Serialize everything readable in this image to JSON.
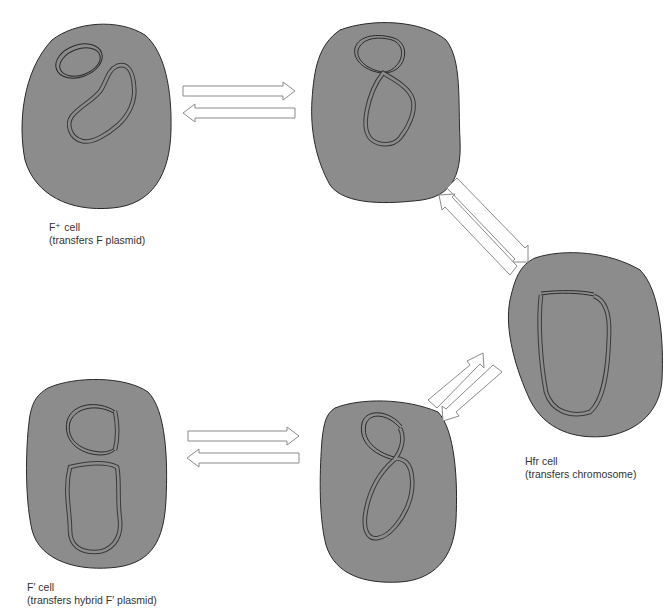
{
  "diagram": {
    "colors": {
      "cell_fill": "#8c8c8c",
      "outline": "#2a2a2a",
      "arrow_outline": "#8a8a8a",
      "label_text": "#333333"
    },
    "cells": [
      {
        "id": "f-plus",
        "name": "F⁺ cell",
        "line1": "F⁺ cell",
        "line2": "(transfers F plasmid)",
        "state": "free F plasmid + chromosome"
      },
      {
        "id": "integrating-top",
        "name": "integrating cell",
        "state": "F plasmid joined to chromosome (figure-eight)"
      },
      {
        "id": "hfr",
        "name": "Hfr cell",
        "line1": "Hfr cell",
        "line2": "(transfers chromosome)",
        "state": "F integrated into chromosome"
      },
      {
        "id": "excising-bottom",
        "name": "excising cell",
        "state": "F plus chromosomal segment looping out (figure-eight)"
      },
      {
        "id": "f-prime",
        "name": "F′ cell",
        "line1": "F′ cell",
        "line2": "(transfers hybrid F′ plasmid)",
        "state": "hybrid F′ plasmid + chromosome"
      }
    ],
    "arrows": [
      {
        "from": "f-plus",
        "to": "integrating-top",
        "type": "reversible"
      },
      {
        "from": "integrating-top",
        "to": "hfr",
        "type": "reversible"
      },
      {
        "from": "hfr",
        "to": "excising-bottom",
        "type": "reversible"
      },
      {
        "from": "excising-bottom",
        "to": "f-prime",
        "type": "reversible"
      }
    ]
  }
}
